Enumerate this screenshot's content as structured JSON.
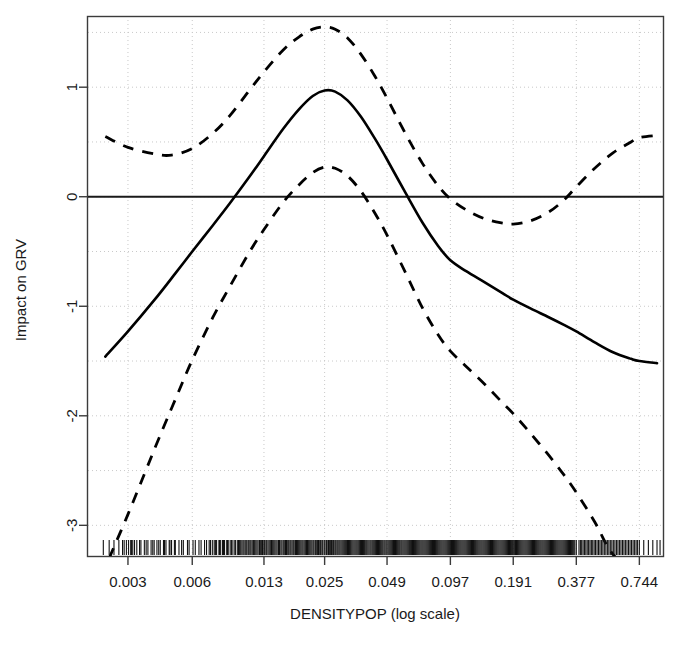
{
  "chart_data": {
    "type": "line",
    "title": "",
    "subtitle": "",
    "xlabel": "DENSITYPOP (log scale)",
    "ylabel": "Impact on GRV",
    "x_scale": "log",
    "grid": true,
    "legend": "none",
    "xlim": [
      0.00195,
      0.96
    ],
    "ylim": [
      -3.28,
      1.65
    ],
    "x_tick_labels": [
      "0.003",
      "0.006",
      "0.013",
      "0.025",
      "0.049",
      "0.097",
      "0.191",
      "0.377",
      "0.744"
    ],
    "x_tick_values": [
      0.003,
      0.006,
      0.013,
      0.025,
      0.049,
      0.097,
      0.191,
      0.377,
      0.744
    ],
    "y_tick_labels": [
      "1",
      "0",
      "-1",
      "-2",
      "-3"
    ],
    "y_tick_values": [
      1,
      0,
      -1,
      -2,
      -3
    ],
    "gridline_y_values": [
      1.5,
      1.0,
      0.5,
      0.0,
      -0.5,
      -1.0,
      -1.5,
      -2.0,
      -2.5,
      -3.0
    ],
    "reference_line_y": 0,
    "series": [
      {
        "name": "fit",
        "style": "solid",
        "color": "#000000",
        "points": [
          [
            0.00235,
            -1.46
          ],
          [
            0.003,
            -1.23
          ],
          [
            0.004,
            -0.94
          ],
          [
            0.005,
            -0.7
          ],
          [
            0.006,
            -0.5
          ],
          [
            0.0075,
            -0.26
          ],
          [
            0.009,
            -0.06
          ],
          [
            0.011,
            0.17
          ],
          [
            0.013,
            0.37
          ],
          [
            0.016,
            0.62
          ],
          [
            0.019,
            0.8
          ],
          [
            0.022,
            0.92
          ],
          [
            0.025,
            0.97
          ],
          [
            0.028,
            0.96
          ],
          [
            0.032,
            0.88
          ],
          [
            0.037,
            0.73
          ],
          [
            0.043,
            0.53
          ],
          [
            0.049,
            0.34
          ],
          [
            0.06,
            0.03
          ],
          [
            0.072,
            -0.24
          ],
          [
            0.085,
            -0.45
          ],
          [
            0.097,
            -0.58
          ],
          [
            0.115,
            -0.68
          ],
          [
            0.14,
            -0.78
          ],
          [
            0.17,
            -0.88
          ],
          [
            0.191,
            -0.94
          ],
          [
            0.23,
            -1.02
          ],
          [
            0.28,
            -1.1
          ],
          [
            0.33,
            -1.17
          ],
          [
            0.377,
            -1.23
          ],
          [
            0.46,
            -1.33
          ],
          [
            0.56,
            -1.42
          ],
          [
            0.68,
            -1.48
          ],
          [
            0.744,
            -1.5
          ],
          [
            0.9,
            -1.52
          ]
        ]
      },
      {
        "name": "upper-confidence-band",
        "style": "dashed",
        "color": "#000000",
        "points": [
          [
            0.00235,
            0.55
          ],
          [
            0.003,
            0.45
          ],
          [
            0.004,
            0.39
          ],
          [
            0.0048,
            0.38
          ],
          [
            0.006,
            0.44
          ],
          [
            0.0075,
            0.58
          ],
          [
            0.009,
            0.74
          ],
          [
            0.011,
            0.96
          ],
          [
            0.013,
            1.14
          ],
          [
            0.016,
            1.34
          ],
          [
            0.019,
            1.46
          ],
          [
            0.022,
            1.53
          ],
          [
            0.025,
            1.55
          ],
          [
            0.028,
            1.53
          ],
          [
            0.032,
            1.45
          ],
          [
            0.037,
            1.3
          ],
          [
            0.043,
            1.1
          ],
          [
            0.049,
            0.9
          ],
          [
            0.06,
            0.57
          ],
          [
            0.072,
            0.3
          ],
          [
            0.085,
            0.1
          ],
          [
            0.097,
            -0.02
          ],
          [
            0.115,
            -0.12
          ],
          [
            0.14,
            -0.2
          ],
          [
            0.17,
            -0.24
          ],
          [
            0.191,
            -0.25
          ],
          [
            0.23,
            -0.22
          ],
          [
            0.28,
            -0.14
          ],
          [
            0.33,
            -0.03
          ],
          [
            0.377,
            0.09
          ],
          [
            0.46,
            0.26
          ],
          [
            0.56,
            0.4
          ],
          [
            0.68,
            0.5
          ],
          [
            0.744,
            0.54
          ],
          [
            0.9,
            0.56
          ]
        ]
      },
      {
        "name": "lower-confidence-band",
        "style": "dashed",
        "color": "#000000",
        "points": [
          [
            0.00245,
            -3.3
          ],
          [
            0.003,
            -2.9
          ],
          [
            0.0036,
            -2.52
          ],
          [
            0.0042,
            -2.2
          ],
          [
            0.005,
            -1.85
          ],
          [
            0.006,
            -1.49
          ],
          [
            0.0075,
            -1.1
          ],
          [
            0.009,
            -0.82
          ],
          [
            0.011,
            -0.52
          ],
          [
            0.013,
            -0.3
          ],
          [
            0.016,
            -0.05
          ],
          [
            0.019,
            0.11
          ],
          [
            0.022,
            0.22
          ],
          [
            0.025,
            0.27
          ],
          [
            0.028,
            0.26
          ],
          [
            0.032,
            0.19
          ],
          [
            0.037,
            0.05
          ],
          [
            0.043,
            -0.15
          ],
          [
            0.049,
            -0.35
          ],
          [
            0.06,
            -0.7
          ],
          [
            0.072,
            -1.02
          ],
          [
            0.085,
            -1.26
          ],
          [
            0.097,
            -1.41
          ],
          [
            0.115,
            -1.55
          ],
          [
            0.14,
            -1.71
          ],
          [
            0.17,
            -1.88
          ],
          [
            0.191,
            -1.98
          ],
          [
            0.23,
            -2.16
          ],
          [
            0.28,
            -2.36
          ],
          [
            0.33,
            -2.54
          ],
          [
            0.377,
            -2.7
          ],
          [
            0.46,
            -2.97
          ],
          [
            0.53,
            -3.2
          ],
          [
            0.58,
            -3.3
          ]
        ]
      }
    ],
    "rug_values": [
      0.0023,
      0.00245,
      0.00258,
      0.00272,
      0.00283,
      0.00295,
      0.00302,
      0.00309,
      0.00316,
      0.00322,
      0.0033,
      0.00345,
      0.00358,
      0.00372,
      0.00385,
      0.00398,
      0.0041,
      0.00425,
      0.0044,
      0.00452,
      0.00468,
      0.0048,
      0.00495,
      0.0052,
      0.00545,
      0.0058,
      0.0062,
      0.0066,
      0.007,
      0.0072,
      0.00745,
      0.0076,
      0.0078,
      0.008,
      0.00815,
      0.00832,
      0.0085,
      0.0087,
      0.0089,
      0.0091,
      0.0093,
      0.0095,
      0.00975,
      0.01,
      0.01025,
      0.0105,
      0.0108,
      0.01105,
      0.0113,
      0.0116,
      0.0119,
      0.0122,
      0.0125,
      0.0128,
      0.0131,
      0.0134,
      0.01375,
      0.0141,
      0.01445,
      0.0148,
      0.0152,
      0.0156,
      0.016,
      0.0164,
      0.0168,
      0.0172,
      0.0176,
      0.018,
      0.01845,
      0.0189,
      0.01935,
      0.0198,
      0.0203,
      0.0208,
      0.0213,
      0.0218,
      0.0223,
      0.02285,
      0.0234,
      0.02395,
      0.0245,
      0.0251,
      0.0257,
      0.0263,
      0.0269,
      0.02755,
      0.0282,
      0.02885,
      0.0295,
      0.0302,
      0.0309,
      0.0316,
      0.03235,
      0.0331,
      0.0339,
      0.0347,
      0.0355,
      0.03635,
      0.0372,
      0.03805,
      0.03895,
      0.03985,
      0.0408,
      0.04175,
      0.0427,
      0.0437,
      0.0447,
      0.04575,
      0.0468,
      0.0479,
      0.049,
      0.05015,
      0.0513,
      0.0525,
      0.0537,
      0.05495,
      0.0562,
      0.0575,
      0.05885,
      0.0602,
      0.0616,
      0.063,
      0.06445,
      0.06595,
      0.06745,
      0.069,
      0.0706,
      0.0722,
      0.07385,
      0.07555,
      0.0773,
      0.07905,
      0.08085,
      0.0827,
      0.0846,
      0.08655,
      0.08855,
      0.0906,
      0.0927,
      0.09485,
      0.097,
      0.09925,
      0.1015,
      0.1038,
      0.1062,
      0.10865,
      0.11115,
      0.1137,
      0.11635,
      0.119,
      0.12175,
      0.12455,
      0.1274,
      0.13035,
      0.13335,
      0.1364,
      0.13955,
      0.14275,
      0.14605,
      0.1494,
      0.15285,
      0.1564,
      0.16,
      0.1637,
      0.1675,
      0.17135,
      0.1753,
      0.17935,
      0.1835,
      0.18775,
      0.191,
      0.1956,
      0.2002,
      0.20485,
      0.2096,
      0.21445,
      0.2194,
      0.2245,
      0.22965,
      0.23495,
      0.2404,
      0.24595,
      0.2516,
      0.2574,
      0.26335,
      0.26945,
      0.27565,
      0.282,
      0.28855,
      0.2952,
      0.302,
      0.309,
      0.3161,
      0.3234,
      0.33085,
      0.3385,
      0.3463,
      0.3543,
      0.36245,
      0.37085,
      0.377,
      0.388,
      0.3995,
      0.4115,
      0.424,
      0.437,
      0.45,
      0.464,
      0.479,
      0.494,
      0.51,
      0.527,
      0.544,
      0.562,
      0.581,
      0.6,
      0.62,
      0.64,
      0.662,
      0.684,
      0.707,
      0.73,
      0.744,
      0.78,
      0.82,
      0.86,
      0.9,
      0.93,
      0.00288,
      0.00312,
      0.0034,
      0.00365,
      0.00392,
      0.00418,
      0.00445,
      0.00472,
      0.005,
      0.00535,
      0.0057,
      0.00605,
      0.00645,
      0.00685,
      0.0073,
      0.0077,
      0.00805,
      0.0084,
      0.00878,
      0.00915,
      0.00955,
      0.00988,
      0.01012,
      0.01038,
      0.01068,
      0.01095,
      0.01118,
      0.01145,
      0.01172,
      0.01205,
      0.01238,
      0.01268,
      0.01298,
      0.01328,
      0.01358,
      0.01392,
      0.01428,
      0.01462,
      0.01498,
      0.01538,
      0.01578,
      0.01618,
      0.01658,
      0.01698,
      0.01738,
      0.01782,
      0.01825,
      0.01868,
      0.01912,
      0.01958,
      0.02005,
      0.02055,
      0.02105,
      0.02155,
      0.02208,
      0.02262,
      0.02318,
      0.02372,
      0.02428,
      0.02488,
      0.02548,
      0.02608,
      0.02668,
      0.02728,
      0.02792,
      0.02855,
      0.02918,
      0.02985,
      0.03055,
      0.03125,
      0.03198,
      0.03272,
      0.0335,
      0.0343,
      0.0351,
      0.03592,
      0.03678,
      0.03762,
      0.03848,
      0.03938,
      0.04032,
      0.04125,
      0.04222,
      0.0432,
      0.0442,
      0.04522,
      0.04628,
      0.04738,
      0.04848,
      0.04958,
      0.05072,
      0.0519,
      0.0531,
      0.05432,
      0.05558,
      0.05688,
      0.05818,
      0.05952,
      0.0609,
      0.06232,
      0.06372,
      0.06518,
      0.06668,
      0.06822,
      0.06978,
      0.0714,
      0.07302,
      0.0747,
      0.07642,
      0.07818,
      0.07995,
      0.08178,
      0.08365,
      0.08558,
      0.08755,
      0.08958,
      0.09165,
      0.09378,
      0.09592,
      0.09812,
      0.10038,
      0.10265,
      0.105,
      0.10742,
      0.1099,
      0.11242,
      0.11502,
      0.11768,
      0.12035,
      0.12315,
      0.12598,
      0.12888,
      0.13185,
      0.13488,
      0.13798,
      0.14115,
      0.1444,
      0.14772,
      0.15112,
      0.15462,
      0.1582,
      0.16185,
      0.1656,
      0.16942,
      0.17332,
      0.17732,
      0.18142,
      0.18562,
      0.1899,
      0.1933,
      0.1979,
      0.2025,
      0.2072,
      0.212,
      0.21692,
      0.22195,
      0.22708,
      0.2323,
      0.23768,
      0.24318,
      0.24878,
      0.2545,
      0.26038,
      0.2664,
      0.27255,
      0.2788,
      0.28528,
      0.2919,
      0.2986,
      0.3055,
      0.31255,
      0.31975,
      0.32712,
      0.33468,
      0.3424,
      0.3503,
      0.35838,
      0.36665,
      0.394,
      0.4055,
      0.4178,
      0.4305,
      0.4435,
      0.457,
      0.4715,
      0.4865,
      0.502,
      0.5185,
      0.5355,
      0.553,
      0.5715,
      0.5905,
      0.61,
      0.63,
      0.651,
      0.673,
      0.6955,
      0.7185
    ]
  },
  "axes": {
    "x_title": "DENSITYPOP (log scale)",
    "y_title": "Impact on GRV"
  }
}
